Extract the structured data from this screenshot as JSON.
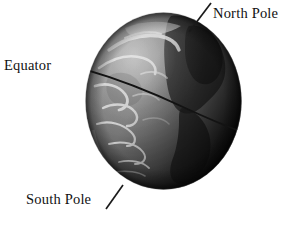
{
  "figure": {
    "type": "labeled-diagram",
    "background_color": "#ffffff",
    "text_color": "#111111"
  },
  "labels": {
    "north_pole": "North Pole",
    "equator": "Equator",
    "south_pole": "South Pole"
  },
  "globe": {
    "description": "grayscale photographic earth globe",
    "equator_line_color": "#141414",
    "ocean_color": "#8c8c8c",
    "land_color": "#3a3a3a",
    "cloud_color": "#e0e0e0",
    "shadow_color": "#101010"
  },
  "caption_fragment": ""
}
